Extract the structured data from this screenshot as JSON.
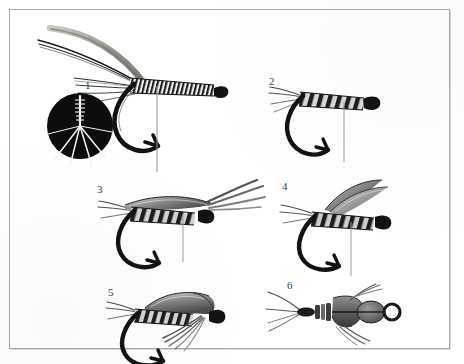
{
  "plate": {
    "title": "Fly tying sequence plate",
    "description": "Six-step black and white line illustration showing the stages of tying a winged wet fly on a hook",
    "background_color": "#ffffff",
    "border_color": "#a9a9a9",
    "ink_color": "#1a1a1a",
    "mid_tone_color": "#7d7d7d",
    "light_tone_color": "#b5b5b5"
  },
  "figures": [
    {
      "number": "1",
      "caption": "Hook with ribbed body, tail fibers and long feather stems; inset circle detail of tail fibers",
      "label_x": 85,
      "label_y": 80,
      "has_inset": true,
      "inset_label": "tail fiber detail",
      "inset_background": "#0d0d0d"
    },
    {
      "number": "2",
      "caption": "Hook with completed segmented body and short tail fibers",
      "label_x": 269,
      "label_y": 76,
      "has_inset": false
    },
    {
      "number": "3",
      "caption": "Body with first wing slip laid over the shank and trailing fibers",
      "label_x": 101,
      "label_y": 190,
      "has_inset": false
    },
    {
      "number": "4",
      "caption": "Paired wing slips raised above the body",
      "label_x": 282,
      "label_y": 188,
      "has_inset": false
    },
    {
      "number": "5",
      "caption": "Finished wet fly with hackle collar and folded wings, side view",
      "label_x": 112,
      "label_y": 292,
      "has_inset": false
    },
    {
      "number": "6",
      "caption": "Finished fly seen from above showing wing pair, head and hook eye",
      "label_x": 287,
      "label_y": 280,
      "has_inset": false
    }
  ]
}
